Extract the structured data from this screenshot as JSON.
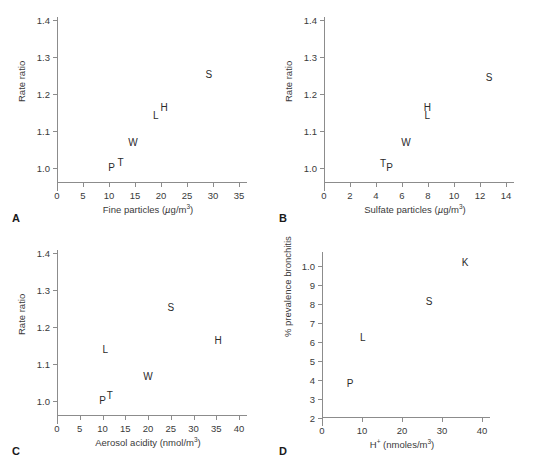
{
  "figure": {
    "background": "#ffffff",
    "axis_color": "#8c8c8c",
    "text_color": "#3a3a3a"
  },
  "chart_data": [
    {
      "type": "scatter",
      "panel": "A",
      "panel_letter": "A",
      "title": "",
      "xlabel": "Fine particles (µg/m3)",
      "xlabel_parts": {
        "text": "Fine particles (",
        "mu": "µ",
        "unit": "g/m",
        "exp": "3",
        "close": ")"
      },
      "ylabel": "Rate ratio",
      "xlim": [
        0,
        35
      ],
      "ylim": [
        0.96,
        1.4
      ],
      "xticks": [
        0,
        5,
        10,
        15,
        20,
        25,
        30,
        35
      ],
      "xticklabels": [
        "0",
        "5",
        "10",
        "15",
        "20",
        "25",
        "30",
        "35"
      ],
      "yticks": [
        1.0,
        1.1,
        1.2,
        1.3,
        1.4
      ],
      "yticklabels": [
        "1.0",
        "1.1",
        "1.2",
        "1.3",
        "1.4"
      ],
      "grid": false,
      "legend": "none",
      "point_labels": [
        "P",
        "T",
        "W",
        "L",
        "H",
        "S"
      ],
      "x": [
        10.5,
        12.2,
        14.6,
        19.0,
        20.6,
        29.2
      ],
      "y": [
        1.0,
        1.013,
        1.068,
        1.14,
        1.163,
        1.251
      ]
    },
    {
      "type": "scatter",
      "panel": "B",
      "panel_letter": "B",
      "title": "",
      "xlabel": "Sulfate particles (µg/m3)",
      "xlabel_parts": {
        "text": "Sulfate particles (",
        "mu": "µ",
        "unit": "g/m",
        "exp": "3",
        "close": ")"
      },
      "ylabel": "Rate ratio",
      "xlim": [
        0,
        14
      ],
      "ylim": [
        0.96,
        1.4
      ],
      "xticks": [
        0,
        2,
        4,
        6,
        8,
        10,
        12,
        14
      ],
      "xticklabels": [
        "0",
        "2",
        "4",
        "6",
        "8",
        "10",
        "12",
        "14"
      ],
      "yticks": [
        1.0,
        1.1,
        1.2,
        1.3,
        1.4
      ],
      "yticklabels": [
        "1.0",
        "1.1",
        "1.2",
        "1.3",
        "1.4"
      ],
      "grid": false,
      "legend": "none",
      "point_labels": [
        "T",
        "P",
        "W",
        "L",
        "H",
        "S"
      ],
      "x": [
        4.55,
        5.05,
        6.3,
        7.95,
        7.95,
        12.7
      ],
      "y": [
        1.012,
        1.0,
        1.068,
        1.142,
        1.163,
        1.243
      ]
    },
    {
      "type": "scatter",
      "panel": "C",
      "panel_letter": "C",
      "title": "",
      "xlabel": "Aerosol acidity (nmol/m3)",
      "xlabel_parts": {
        "text": "Aerosol acidity (nmol/m",
        "exp": "3",
        "close": ")"
      },
      "ylabel": "Rate ratio",
      "xlim": [
        0,
        40
      ],
      "ylim": [
        0.96,
        1.4
      ],
      "xticks": [
        0,
        5,
        10,
        15,
        20,
        25,
        30,
        35,
        40
      ],
      "xticklabels": [
        "0",
        "5",
        "10",
        "15",
        "20",
        "25",
        "30",
        "35",
        "40"
      ],
      "yticks": [
        1.0,
        1.1,
        1.2,
        1.3,
        1.4
      ],
      "yticklabels": [
        "1.0",
        "1.1",
        "1.2",
        "1.3",
        "1.4"
      ],
      "grid": false,
      "legend": "none",
      "point_labels": [
        "P",
        "T",
        "L",
        "W",
        "S",
        "H"
      ],
      "x": [
        10.0,
        11.6,
        10.6,
        20.0,
        25.0,
        35.4
      ],
      "y": [
        1.0,
        1.014,
        1.137,
        1.066,
        1.251,
        1.163
      ]
    },
    {
      "type": "scatter",
      "panel": "D",
      "panel_letter": "D",
      "title": "",
      "xlabel": "H+ (nmoles/m3)",
      "xlabel_parts": {
        "text": "H",
        "sup1": "+",
        "mid": " (nmoles/m",
        "exp": "3",
        "close": ")"
      },
      "ylabel": "% prevalence bronchitis",
      "xlim": [
        0,
        40
      ],
      "ylim": [
        2,
        10.6
      ],
      "xticks": [
        0,
        10,
        20,
        30,
        40
      ],
      "xticklabels": [
        "0",
        "10",
        "20",
        "30",
        "40"
      ],
      "yticks": [
        2,
        3,
        4,
        5,
        6,
        7,
        8,
        9,
        10
      ],
      "yticklabels": [
        "2",
        "3",
        "4",
        "5",
        "6",
        "7",
        "8",
        "9",
        "1.0"
      ],
      "grid": false,
      "legend": "none",
      "point_labels": [
        "P",
        "L",
        "S",
        "K"
      ],
      "x": [
        7.0,
        10.2,
        26.8,
        35.8
      ],
      "y": [
        3.8,
        6.2,
        8.1,
        10.2
      ]
    }
  ]
}
